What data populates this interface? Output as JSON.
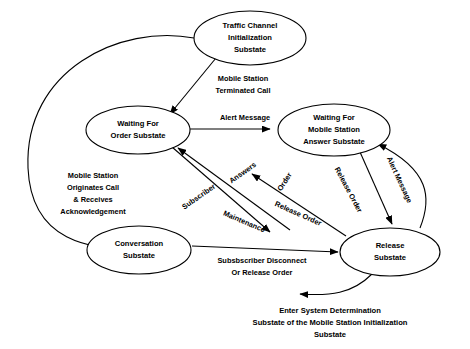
{
  "diagram": {
    "states": [
      {
        "id": "traffic-channel-initialization",
        "lines": [
          "Traffic Channel",
          "Initialization",
          "Substate"
        ],
        "cx": 250,
        "cy": 38,
        "rx": 56,
        "ry": 27
      },
      {
        "id": "waiting-for-order",
        "lines": [
          "Waiting For",
          "Order Substate"
        ],
        "cx": 138,
        "cy": 130,
        "rx": 52,
        "ry": 24
      },
      {
        "id": "waiting-for-mobile-station-answer",
        "lines": [
          "Waiting For",
          "Mobile Station",
          "Answer Substate"
        ],
        "cx": 334,
        "cy": 130,
        "rx": 56,
        "ry": 26
      },
      {
        "id": "conversation",
        "lines": [
          "Conversation",
          "Substate"
        ],
        "cx": 139,
        "cy": 250,
        "rx": 52,
        "ry": 24
      },
      {
        "id": "release",
        "lines": [
          "Release",
          "Substate"
        ],
        "cx": 390,
        "cy": 252,
        "rx": 50,
        "ry": 24
      }
    ],
    "edge_labels": [
      {
        "id": "mobile-station-terminated-call",
        "lines": [
          "Mobile Station",
          "Terminated Call"
        ],
        "x": 243,
        "y": 83,
        "rotate": 0
      },
      {
        "id": "mobile-station-originates-call",
        "lines": [
          "Mobile Station",
          "Originates Call",
          "& Receives",
          "Acknowledgement"
        ],
        "x": 93,
        "y": 190,
        "rotate": 0
      },
      {
        "id": "alert-message-top",
        "lines": [
          "Alert Message"
        ],
        "x": 245,
        "y": 118,
        "rotate": 0
      },
      {
        "id": "subscriber",
        "lines": [
          "Subscriber"
        ],
        "x": 199,
        "y": 197,
        "rotate": -35
      },
      {
        "id": "answers",
        "lines": [
          "Answers"
        ],
        "x": 243,
        "y": 173,
        "rotate": -35
      },
      {
        "id": "order",
        "lines": [
          "Order"
        ],
        "x": 285,
        "y": 182,
        "rotate": -58
      },
      {
        "id": "alert-message-right",
        "lines": [
          "Alert Message"
        ],
        "x": 399,
        "y": 180,
        "rotate": 65
      },
      {
        "id": "release-order-upper",
        "lines": [
          "Release Order"
        ],
        "x": 348,
        "y": 190,
        "rotate": 62
      },
      {
        "id": "release-order-lower",
        "lines": [
          "Release Order"
        ],
        "x": 298,
        "y": 214,
        "rotate": 24
      },
      {
        "id": "maintenance",
        "lines": [
          "Maintenance"
        ],
        "x": 244,
        "y": 222,
        "rotate": 23
      },
      {
        "id": "subscriber-disconnect",
        "lines": [
          "Subsbscriber Disconnect",
          "Or Release Order"
        ],
        "x": 262,
        "y": 265,
        "rotate": 0
      }
    ],
    "caption": {
      "id": "enter-system-determination-caption",
      "lines": [
        "Enter System Determination",
        "Substate of the Mobile Station Initialization",
        "Substate"
      ],
      "x": 330,
      "y": 315
    },
    "colors": {
      "stroke": "#000000",
      "fill": "#ffffff",
      "text": "#000000",
      "background": "#ffffff"
    }
  }
}
